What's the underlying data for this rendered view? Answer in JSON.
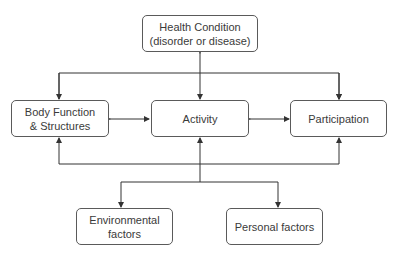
{
  "diagram": {
    "nodes": {
      "health": {
        "line1": "Health Condition",
        "line2": "(disorder or disease)"
      },
      "body": {
        "line1": "Body Function",
        "line2": "& Structures"
      },
      "activity": {
        "label": "Activity"
      },
      "participation": {
        "label": "Participation"
      },
      "environmental": {
        "line1": "Environmental",
        "line2": "factors"
      },
      "personal": {
        "label": "Personal factors"
      }
    },
    "edges": [
      {
        "from": "health",
        "to": "activity",
        "type": "bidirectional"
      },
      {
        "from": "health",
        "to": "body",
        "type": "directed"
      },
      {
        "from": "health",
        "to": "participation",
        "type": "directed"
      },
      {
        "from": "body",
        "to": "activity",
        "type": "bidirectional"
      },
      {
        "from": "activity",
        "to": "participation",
        "type": "bidirectional"
      },
      {
        "from": "contextual",
        "to": "body",
        "type": "directed"
      },
      {
        "from": "contextual",
        "to": "activity",
        "type": "directed"
      },
      {
        "from": "contextual",
        "to": "participation",
        "type": "directed"
      },
      {
        "from": "contextual",
        "to": "environmental",
        "type": "directed"
      },
      {
        "from": "contextual",
        "to": "personal",
        "type": "directed"
      }
    ],
    "colors": {
      "line": "#333333",
      "border": "#5a5a5a",
      "text": "#3a3a3a"
    }
  }
}
